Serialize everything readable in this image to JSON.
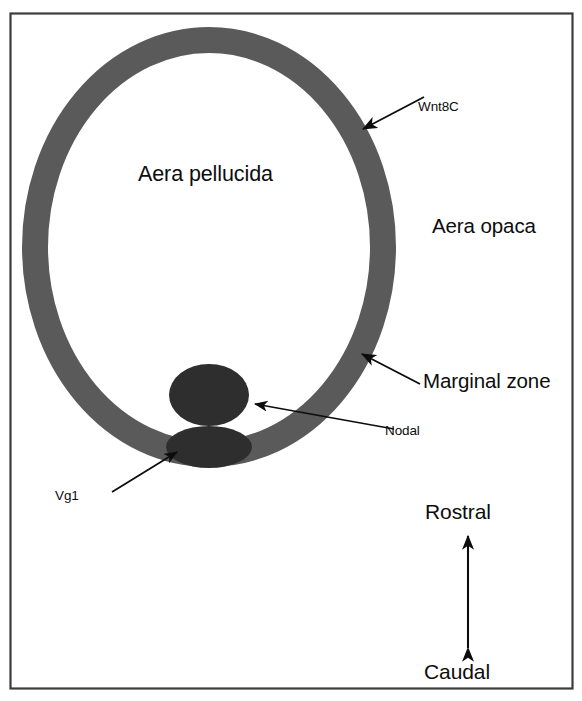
{
  "figure": {
    "kind": "biological-schematic",
    "background_color": "#ffffff",
    "frame": {
      "border_color": "#3c3c3c",
      "x": 10,
      "y": 13,
      "width": 562,
      "height": 675
    }
  },
  "shapes": {
    "ring": {
      "name": "marginal-zone-ring",
      "fill": "none",
      "stroke_color": "#5a5a5a",
      "stroke_width": 26,
      "cx": 209,
      "cy": 247,
      "rx": 174,
      "ry": 207
    },
    "nodal_blob": {
      "name": "nodal-domain",
      "fill": "#2e2e2e",
      "cx": 209,
      "cy": 395,
      "rx": 40,
      "ry": 31
    },
    "vg1_blob": {
      "name": "vg1-domain",
      "fill": "#2e2e2e",
      "cx": 209,
      "cy": 447,
      "rx": 43,
      "ry": 21
    }
  },
  "labels": {
    "aera_pellucida": "Aera pellucida",
    "aera_opaca": "Aera opaca",
    "wnt8c": "Wnt8C",
    "marginal_zone": "Marginal zone",
    "nodal": "Nodal",
    "vg1": "Vg1",
    "rostral": "Rostral",
    "caudal": "Caudal"
  },
  "leader_lines": [
    {
      "name": "wnt8c-leader",
      "label": "Wnt8C",
      "from_x": 424,
      "from_y": 97,
      "to_x": 363,
      "to_y": 129,
      "arrowhead": "end"
    },
    {
      "name": "marginal-zone-leader",
      "label": "Marginal zone",
      "from_x": 420,
      "from_y": 384,
      "to_x": 362,
      "to_y": 354,
      "arrowhead": "end"
    },
    {
      "name": "nodal-leader",
      "label": "Nodal",
      "from_x": 394,
      "from_y": 429,
      "to_x": 255,
      "to_y": 404,
      "arrowhead": "end"
    },
    {
      "name": "vg1-leader",
      "label": "Vg1",
      "from_x": 112,
      "from_y": 492,
      "to_x": 177,
      "to_y": 452,
      "arrowhead": "end"
    }
  ],
  "axis_arrow": {
    "name": "rostral-caudal-axis",
    "orientation": "vertical",
    "double_headed": true,
    "top_label": "Rostral",
    "bottom_label": "Caudal",
    "x": 468,
    "top_y": 536,
    "bottom_y": 648,
    "color": "#0d0d0d"
  },
  "label_positions": {
    "aera_pellucida": {
      "left": 138,
      "top": 164
    },
    "aera_opaca": {
      "left": 432,
      "top": 216
    },
    "wnt8c": {
      "left": 418,
      "top": 100
    },
    "marginal_zone": {
      "left": 423,
      "top": 371
    },
    "nodal": {
      "left": 385,
      "top": 424
    },
    "vg1": {
      "left": 55,
      "top": 489
    },
    "rostral": {
      "left": 425,
      "top": 501
    },
    "caudal": {
      "left": 424,
      "top": 661
    }
  },
  "colors": {
    "ring_gray": "#5a5a5a",
    "blob_dark": "#2e2e2e",
    "ink": "#0d0d0d",
    "frame": "#3c3c3c",
    "paper": "#ffffff"
  }
}
